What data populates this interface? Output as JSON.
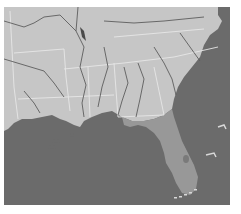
{
  "map": {
    "region": "Southeastern United States",
    "highlighted_region": "Florida",
    "colors": {
      "land": "#c6c6c6",
      "water": "#6b6b6b",
      "highlight": "#989898",
      "border": "#e6e6e6",
      "river": "#5e5e5e",
      "background": "#ffffff"
    },
    "labels": []
  }
}
